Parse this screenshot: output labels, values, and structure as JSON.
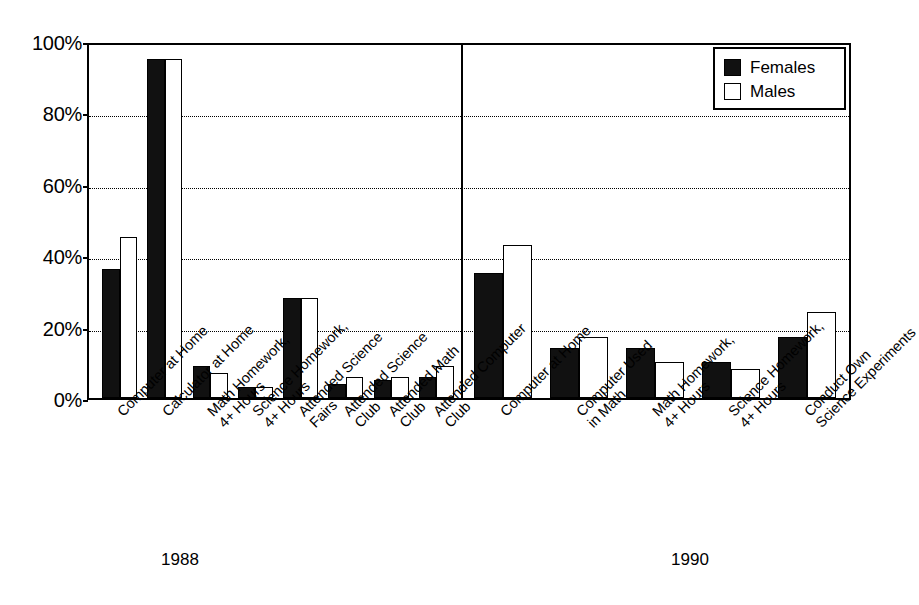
{
  "chart_data": {
    "type": "bar",
    "title": "",
    "subtitle": "",
    "xlabel": "",
    "ylabel": "",
    "ylim": [
      0,
      100
    ],
    "grid": true,
    "y_ticks": [
      "0%",
      "20%",
      "40%",
      "60%",
      "80%",
      "100%"
    ],
    "y_tick_values": [
      0,
      20,
      40,
      60,
      80,
      100
    ],
    "legend": {
      "position": "top-right",
      "entries": [
        {
          "name": "Females",
          "color": "#111111",
          "swatch": "filled"
        },
        {
          "name": "Males",
          "color": "#ffffff",
          "swatch": "outlined"
        }
      ]
    },
    "groups": [
      {
        "name": "1988",
        "categories": [
          "Computer at Home",
          "Calculator at Home",
          "Math Homework, 4+ Hours",
          "Science Homework, 4+ Hours",
          "Attended Science Fairs",
          "Attended Science Club",
          "Attended Math Club",
          "Attended Computer Club"
        ],
        "series": [
          {
            "name": "Females",
            "values": [
              36,
              95,
              9,
              3,
              28,
              4,
              5,
              6
            ]
          },
          {
            "name": "Males",
            "values": [
              45,
              95,
              7,
              3,
              28,
              6,
              6,
              9
            ]
          }
        ]
      },
      {
        "name": "1990",
        "categories": [
          "Computer at Home",
          "Computer Used in Math",
          "Math Homework, 4+ Hours",
          "Science Homework, 4+ Hours",
          "Conduct Own Science Experiments"
        ],
        "series": [
          {
            "name": "Females",
            "values": [
              35,
              14,
              14,
              10,
              17
            ]
          },
          {
            "name": "Males",
            "values": [
              43,
              17,
              10,
              8,
              24
            ]
          }
        ]
      }
    ]
  },
  "axis": {
    "ticks": [
      {
        "label": "100%"
      },
      {
        "label": "80%"
      },
      {
        "label": "60%"
      },
      {
        "label": "40%"
      },
      {
        "label": "20%"
      },
      {
        "label": "0%"
      }
    ]
  },
  "legend": {
    "females_label": "Females",
    "males_label": "Males"
  },
  "categories_1988": [
    {
      "lines": [
        "Computer at Home"
      ]
    },
    {
      "lines": [
        "Calculator at Home"
      ]
    },
    {
      "lines": [
        "Math Homework,",
        "4+ Hours"
      ]
    },
    {
      "lines": [
        "Science Homework,",
        "4+ Hours"
      ]
    },
    {
      "lines": [
        "Attended Science",
        "Fairs"
      ]
    },
    {
      "lines": [
        "Attended Science",
        "Club"
      ]
    },
    {
      "lines": [
        "Attended Math",
        "Club"
      ]
    },
    {
      "lines": [
        "Attended Computer",
        "Club"
      ]
    }
  ],
  "categories_1990": [
    {
      "lines": [
        "Computer at Home"
      ]
    },
    {
      "lines": [
        "Computer Used",
        "in Math"
      ]
    },
    {
      "lines": [
        "Math Homework,",
        "4+ Hours"
      ]
    },
    {
      "lines": [
        "Science Homework,",
        "4+ Hours"
      ]
    },
    {
      "lines": [
        "Conduct Own",
        "Science Experiments"
      ]
    }
  ],
  "year_labels": {
    "left": "1988",
    "right": "1990"
  },
  "colors": {
    "females": "#111111",
    "males": "#ffffff",
    "axis": "#000000"
  }
}
